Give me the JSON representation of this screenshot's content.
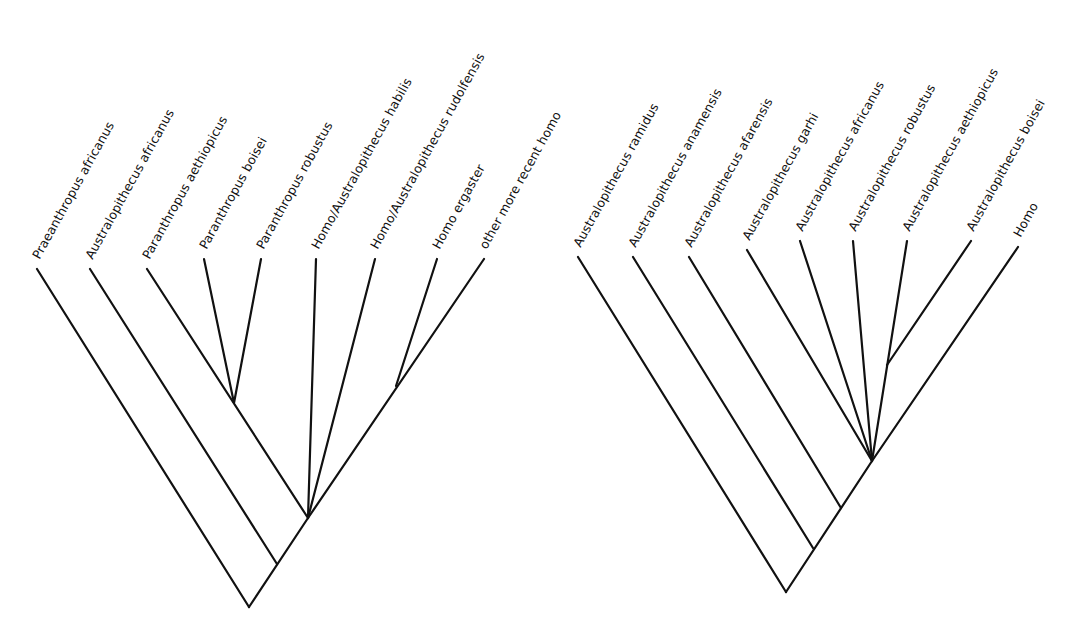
{
  "diagram": {
    "type": "cladogram",
    "style": {
      "line_color": "#111111",
      "background": "#ffffff",
      "label_angle_deg": -61
    },
    "trees": [
      {
        "id": "left",
        "taxa": [
          {
            "label": "Praeanthropus africanus",
            "tip": [
              37,
              269
            ]
          },
          {
            "label": "Australopithecus africanus",
            "tip": [
              90,
              269
            ]
          },
          {
            "label": "Paranthropus aethiopicus",
            "tip": [
              147,
              269
            ]
          },
          {
            "label": "Paranthropus boisei",
            "tip": [
              204,
              259
            ]
          },
          {
            "label": "Paranthropus robustus",
            "tip": [
              261,
              259
            ]
          },
          {
            "label": "Homo/Australopithecus habilis",
            "tip": [
              316,
              259
            ]
          },
          {
            "label": "Homo/Australopithecus rudolfensis",
            "tip": [
              375,
              259
            ]
          },
          {
            "label": "Homo ergaster",
            "tip": [
              437,
              259
            ]
          },
          {
            "label": "other more recent homo",
            "tip": [
              484,
              259
            ]
          }
        ],
        "branches": [
          [
            [
              37,
              269
            ],
            [
              249,
              607
            ]
          ],
          [
            [
              249,
              607
            ],
            [
              308,
              518
            ]
          ],
          [
            [
              90,
              269
            ],
            [
              277,
              564
            ]
          ],
          [
            [
              147,
              269
            ],
            [
              308,
              518
            ]
          ],
          [
            [
              204,
              259
            ],
            [
              234,
              403
            ]
          ],
          [
            [
              261,
              259
            ],
            [
              234,
              403
            ]
          ],
          [
            [
              316,
              259
            ],
            [
              308,
              518
            ]
          ],
          [
            [
              375,
              259
            ],
            [
              308,
              518
            ]
          ],
          [
            [
              484,
              259
            ],
            [
              308,
              518
            ]
          ],
          [
            [
              437,
              259
            ],
            [
              396,
              386
            ]
          ]
        ]
      },
      {
        "id": "right",
        "taxa": [
          {
            "label": "Australopithecus ramidus",
            "tip": [
              578,
              257
            ]
          },
          {
            "label": "Australopithecus anamensis",
            "tip": [
              633,
              257
            ]
          },
          {
            "label": "Australopithecus afarensis",
            "tip": [
              689,
              257
            ]
          },
          {
            "label": "Australopithecus garhi",
            "tip": [
              747,
              250
            ]
          },
          {
            "label": "Australopithecus africanus",
            "tip": [
              800,
              241
            ]
          },
          {
            "label": "Australopithecus robustus",
            "tip": [
              853,
              241
            ]
          },
          {
            "label": "Australopithecus aethiopicus",
            "tip": [
              907,
              241
            ]
          },
          {
            "label": "Australopithecus boisei",
            "tip": [
              971,
              241
            ]
          },
          {
            "label": "Homo",
            "tip": [
              1018,
              247
            ]
          }
        ],
        "branches": [
          [
            [
              578,
              257
            ],
            [
              786,
              592
            ]
          ],
          [
            [
              786,
              592
            ],
            [
              872,
              461
            ]
          ],
          [
            [
              872,
              461
            ],
            [
              1018,
              247
            ]
          ],
          [
            [
              633,
              257
            ],
            [
              813,
              548
            ]
          ],
          [
            [
              689,
              257
            ],
            [
              841,
              508
            ]
          ],
          [
            [
              747,
              250
            ],
            [
              872,
              461
            ]
          ],
          [
            [
              800,
              241
            ],
            [
              872,
              461
            ]
          ],
          [
            [
              853,
              241
            ],
            [
              872,
              461
            ]
          ],
          [
            [
              907,
              241
            ],
            [
              872,
              461
            ]
          ],
          [
            [
              971,
              241
            ],
            [
              887,
              365
            ]
          ]
        ]
      }
    ]
  }
}
